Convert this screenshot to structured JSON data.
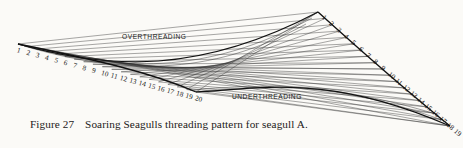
{
  "figure": {
    "caption_number": "Figure 27",
    "caption_text": "Soaring Seagulls threading pattern for seagull A.",
    "labels": {
      "over": "OVERTHREADING",
      "under": "UNDERTHREADING"
    },
    "ink_color": "#161616",
    "paper_color": "#fbfaf7"
  },
  "chart_data": {
    "type": "line",
    "title": "Soaring Seagulls threading pattern for seagull A.",
    "subtitle": "Figure 27",
    "grid": false,
    "legend_position": "inline-annotation",
    "xlabel": "",
    "ylabel": "",
    "annotations": [
      {
        "text": "OVERTHREADING",
        "x": 122,
        "y": 39
      },
      {
        "text": "UNDERTHREADING",
        "x": 232,
        "y": 99
      }
    ],
    "series": [
      {
        "name": "left_rail_pins",
        "role": "overthreading rail",
        "labels": [
          "1",
          "2",
          "3",
          "4",
          "5",
          "6",
          "7",
          "8",
          "9",
          "10",
          "11",
          "12",
          "13",
          "14",
          "15",
          "16",
          "17",
          "18",
          "19",
          "20"
        ],
        "count": 20,
        "start": [
          18,
          44
        ],
        "end": [
          196,
          92
        ]
      },
      {
        "name": "right_rail_pins",
        "role": "underthreading rail",
        "labels": [
          "1",
          "2",
          "3",
          "4",
          "5",
          "6",
          "7",
          "8",
          "9",
          "10",
          "11",
          "12",
          "13",
          "14",
          "15",
          "16",
          "17",
          "18",
          "19"
        ],
        "count": 19,
        "start": [
          318,
          12
        ],
        "end": [
          450,
          126
        ]
      },
      {
        "name": "threads",
        "role": "connecting strings forming envelope",
        "count": 20
      }
    ],
    "xlim": [
      0,
      463
    ],
    "ylim": [
      0,
      148
    ]
  }
}
